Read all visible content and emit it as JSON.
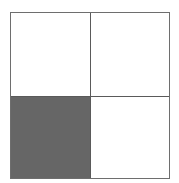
{
  "diagram": {
    "type": "2x2 grid",
    "rows": 2,
    "cols": 2,
    "border_color": "#6e6e6e",
    "fill_color": "#666666",
    "cells": [
      {
        "row": 0,
        "col": 0,
        "filled": false
      },
      {
        "row": 0,
        "col": 1,
        "filled": false
      },
      {
        "row": 1,
        "col": 0,
        "filled": true
      },
      {
        "row": 1,
        "col": 1,
        "filled": false
      }
    ]
  }
}
